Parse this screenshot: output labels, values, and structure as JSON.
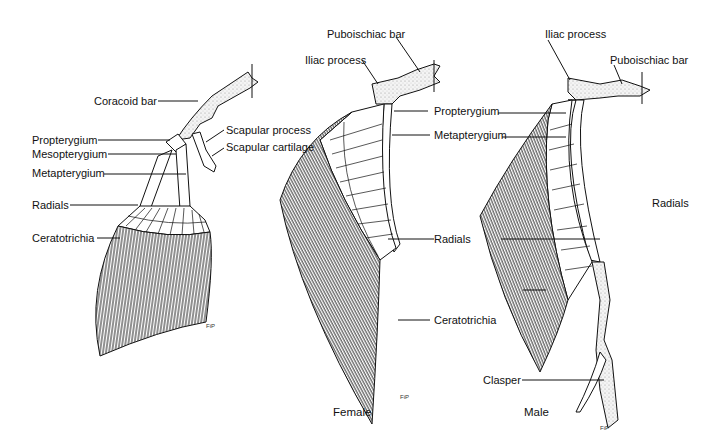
{
  "figure": {
    "panels": [
      {
        "id": "pectoral",
        "caption": "",
        "labels": {
          "coracoid_bar": "Coracoid bar",
          "propterygium": "Propterygium",
          "mesopterygium": "Mesopterygium",
          "metapterygium": "Metapterygium",
          "radials": "Radials",
          "ceratotrichia": "Ceratotrichia",
          "scapular_process": "Scapular process",
          "scapular_cartilage": "Scapular cartilage"
        },
        "signature": "FiP"
      },
      {
        "id": "female-pelvic",
        "caption": "Female",
        "labels": {
          "puboischiac_bar": "Puboischiac bar",
          "iliac_process": "Iliac process",
          "propterygium": "Propterygium",
          "metapterygium": "Metapterygium",
          "radials": "Radials",
          "ceratotrichia": "Ceratotrichia"
        },
        "signature": "FiP"
      },
      {
        "id": "male-pelvic",
        "caption": "Male",
        "labels": {
          "iliac_process": "Iliac process",
          "puboischiac_bar": "Puboischiac bar",
          "radials": "Radials",
          "clasper": "Clasper"
        },
        "signature": "FiP"
      }
    ]
  },
  "colors": {
    "ink": "#111111",
    "cartilage": "#f2f2f2",
    "rays": "#3a3a3a"
  }
}
